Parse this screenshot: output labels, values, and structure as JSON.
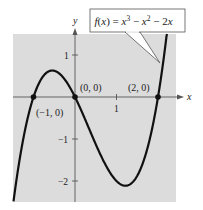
{
  "chart_data": {
    "type": "line",
    "function": "x^3 - x^2 - 2x",
    "xlabel": "x",
    "ylabel": "y",
    "xlim": [
      -1.5,
      2.45
    ],
    "ylim": [
      -2.5,
      1.5
    ],
    "grid": false,
    "x_ticks": [
      {
        "value": 1,
        "label": "1"
      }
    ],
    "y_ticks": [
      {
        "value": 1,
        "label": "1"
      },
      {
        "value": -1,
        "label": "−1"
      },
      {
        "value": -2,
        "label": "−2"
      }
    ],
    "annotated_points": [
      {
        "x": -1,
        "y": 0,
        "label": "(−1, 0)"
      },
      {
        "x": 0,
        "y": 0,
        "label": "(0, 0)"
      },
      {
        "x": 2,
        "y": 0,
        "label": "(2, 0)"
      }
    ],
    "series": [
      {
        "name": "f(x) = x^3 - x^2 - 2x",
        "x": [
          -1.5,
          -1.25,
          -1.0,
          -0.75,
          -0.55,
          -0.25,
          0.0,
          0.25,
          0.5,
          0.75,
          1.0,
          1.22,
          1.5,
          1.75,
          2.0,
          2.25,
          2.45
        ],
        "values": [
          -2.625,
          -0.95,
          0.0,
          0.516,
          0.631,
          0.422,
          0.0,
          -0.547,
          -1.125,
          -1.641,
          -2.0,
          -2.113,
          -1.875,
          -1.137,
          0.0,
          1.641,
          3.58
        ]
      }
    ],
    "colors": {
      "background": "#dcdcdc",
      "curve": "#111111",
      "axes": "#555555"
    }
  },
  "labels": {
    "callout": "f(x) = x³ − x² − 2x",
    "callout_fx": "f",
    "callout_rest": "(x) = x",
    "x_axis": "x",
    "y_axis": "y",
    "tick_x1": "1",
    "tick_y1": "1",
    "tick_ym1": "−1",
    "tick_ym2": "−2",
    "pt_m1": "(−1, 0)",
    "pt_0": "(0, 0)",
    "pt_2": "(2, 0)"
  }
}
